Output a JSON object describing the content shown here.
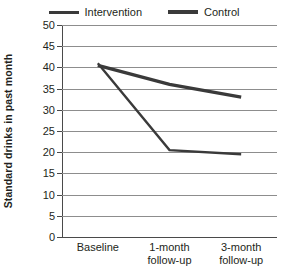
{
  "chart_data": {
    "type": "line",
    "title": "",
    "xlabel": "",
    "ylabel": "Standard drinks in past month",
    "categories": [
      "Baseline",
      "1-month\nfollow-up",
      "3-month\nfollow-up"
    ],
    "category_labels": [
      {
        "line1": "Baseline",
        "line2": ""
      },
      {
        "line1": "1-month",
        "line2": "follow-up"
      },
      {
        "line1": "3-month",
        "line2": "follow-up"
      }
    ],
    "series": [
      {
        "name": "Intervention",
        "values": [
          41,
          20.5,
          19.5
        ],
        "color": "#3a3a3a",
        "width": 2.4
      },
      {
        "name": "Control",
        "values": [
          40.5,
          36,
          33
        ],
        "color": "#3a3a3a",
        "width": 3.4
      }
    ],
    "ylim": [
      0,
      50
    ],
    "ytick_step": 5,
    "yticks": [
      50,
      45,
      40,
      35,
      30,
      25,
      20,
      15,
      10,
      5,
      0
    ],
    "ytick_labels": [
      "50",
      "45",
      "40",
      "35",
      "30",
      "25",
      "20",
      "15",
      "10",
      "5",
      "0"
    ],
    "grid": "horizontal",
    "legend_position": "top",
    "legend": [
      {
        "label": "Intervention",
        "style": "thin"
      },
      {
        "label": "Control",
        "style": "thick"
      }
    ],
    "colors": {
      "line": "#3a3a3a",
      "grid": "#8d8d8d",
      "axis": "#4a4a4a",
      "text": "#231f20",
      "background": "#ffffff"
    }
  }
}
